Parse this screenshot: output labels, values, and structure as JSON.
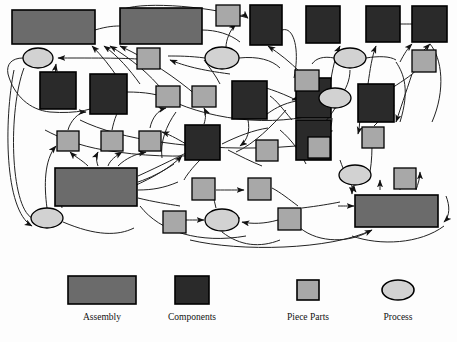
{
  "diagram": {
    "type": "network-relationship-diagram",
    "title_visible": false,
    "background": "#fdfdfd",
    "palette": {
      "assembly_fill": "#6b6b6b",
      "components_fill": "#2a2a2a",
      "piece_parts_fill": "#a8a8a8",
      "process_fill": "#d2d2d2",
      "stroke": "#000000",
      "edge_stroke": "#1a1a1a"
    },
    "node_counts": {
      "assembly": 4,
      "components": 11,
      "piece_parts": 16,
      "process": 6,
      "total": 37
    },
    "nodes": [
      {
        "id": "A1",
        "kind": "assembly",
        "x": 12,
        "y": 10,
        "w": 83,
        "h": 34
      },
      {
        "id": "A2",
        "kind": "assembly",
        "x": 120,
        "y": 8,
        "w": 82,
        "h": 36
      },
      {
        "id": "A3",
        "kind": "assembly",
        "x": 55,
        "y": 168,
        "w": 82,
        "h": 38
      },
      {
        "id": "A4",
        "kind": "assembly",
        "x": 355,
        "y": 195,
        "w": 83,
        "h": 32
      },
      {
        "id": "C1",
        "kind": "components",
        "x": 40,
        "y": 72,
        "w": 36,
        "h": 37
      },
      {
        "id": "C2",
        "kind": "components",
        "x": 90,
        "y": 74,
        "w": 37,
        "h": 40
      },
      {
        "id": "C3",
        "kind": "components",
        "x": 250,
        "y": 5,
        "w": 32,
        "h": 40
      },
      {
        "id": "C4",
        "kind": "components",
        "x": 306,
        "y": 6,
        "w": 34,
        "h": 37
      },
      {
        "id": "C5",
        "kind": "components",
        "x": 366,
        "y": 6,
        "w": 34,
        "h": 36
      },
      {
        "id": "C6",
        "kind": "components",
        "x": 412,
        "y": 6,
        "w": 35,
        "h": 36
      },
      {
        "id": "C7",
        "kind": "components",
        "x": 232,
        "y": 81,
        "w": 35,
        "h": 38
      },
      {
        "id": "C8",
        "kind": "components",
        "x": 296,
        "y": 78,
        "w": 35,
        "h": 40
      },
      {
        "id": "C9",
        "kind": "components",
        "x": 358,
        "y": 84,
        "w": 36,
        "h": 38
      },
      {
        "id": "C10",
        "kind": "components",
        "x": 185,
        "y": 125,
        "w": 35,
        "h": 35
      },
      {
        "id": "C11",
        "kind": "components",
        "x": 296,
        "y": 120,
        "w": 35,
        "h": 40
      },
      {
        "id": "P1",
        "kind": "piece_parts",
        "x": 137,
        "y": 48,
        "w": 23,
        "h": 21
      },
      {
        "id": "P2",
        "kind": "piece_parts",
        "x": 216,
        "y": 5,
        "w": 24,
        "h": 21
      },
      {
        "id": "P3",
        "kind": "piece_parts",
        "x": 412,
        "y": 50,
        "w": 24,
        "h": 22
      },
      {
        "id": "P4",
        "kind": "piece_parts",
        "x": 156,
        "y": 86,
        "w": 24,
        "h": 21
      },
      {
        "id": "P5",
        "kind": "piece_parts",
        "x": 192,
        "y": 86,
        "w": 24,
        "h": 21
      },
      {
        "id": "P6",
        "kind": "piece_parts",
        "x": 295,
        "y": 70,
        "w": 24,
        "h": 21
      },
      {
        "id": "P7",
        "kind": "piece_parts",
        "x": 57,
        "y": 131,
        "w": 22,
        "h": 20
      },
      {
        "id": "P8",
        "kind": "piece_parts",
        "x": 101,
        "y": 131,
        "w": 22,
        "h": 20
      },
      {
        "id": "P9",
        "kind": "piece_parts",
        "x": 139,
        "y": 131,
        "w": 22,
        "h": 20
      },
      {
        "id": "P10",
        "kind": "piece_parts",
        "x": 256,
        "y": 140,
        "w": 22,
        "h": 21
      },
      {
        "id": "P11",
        "kind": "piece_parts",
        "x": 308,
        "y": 137,
        "w": 22,
        "h": 21
      },
      {
        "id": "P12",
        "kind": "piece_parts",
        "x": 362,
        "y": 127,
        "w": 22,
        "h": 21
      },
      {
        "id": "P13",
        "kind": "piece_parts",
        "x": 394,
        "y": 168,
        "w": 22,
        "h": 21
      },
      {
        "id": "P14",
        "kind": "piece_parts",
        "x": 192,
        "y": 178,
        "w": 23,
        "h": 22
      },
      {
        "id": "P15",
        "kind": "piece_parts",
        "x": 248,
        "y": 178,
        "w": 23,
        "h": 22
      },
      {
        "id": "P16",
        "kind": "piece_parts",
        "x": 278,
        "y": 208,
        "w": 23,
        "h": 22
      },
      {
        "id": "P17",
        "kind": "piece_parts",
        "x": 163,
        "y": 211,
        "w": 23,
        "h": 22
      },
      {
        "id": "R1",
        "kind": "process",
        "cx": 38,
        "cy": 58,
        "rx": 15,
        "ry": 10
      },
      {
        "id": "R2",
        "kind": "process",
        "cx": 222,
        "cy": 58,
        "rx": 17,
        "ry": 11
      },
      {
        "id": "R3",
        "kind": "process",
        "cx": 350,
        "cy": 58,
        "rx": 16,
        "ry": 10
      },
      {
        "id": "R4",
        "kind": "process",
        "cx": 335,
        "cy": 98,
        "rx": 16,
        "ry": 10
      },
      {
        "id": "R5",
        "kind": "process",
        "cx": 355,
        "cy": 175,
        "rx": 16,
        "ry": 10
      },
      {
        "id": "R6",
        "kind": "process",
        "cx": 47,
        "cy": 218,
        "rx": 16,
        "ry": 10
      },
      {
        "id": "R7",
        "kind": "process",
        "cx": 222,
        "cy": 220,
        "rx": 17,
        "ry": 11
      }
    ]
  },
  "legend": {
    "items": [
      {
        "key": "assembly",
        "label": "Assembly",
        "swatch": "rect-wide",
        "fill": "#6b6b6b"
      },
      {
        "key": "components",
        "label": "Components",
        "swatch": "rect-square",
        "fill": "#2a2a2a"
      },
      {
        "key": "piece_parts",
        "label": "Piece Parts",
        "swatch": "rect-small",
        "fill": "#a8a8a8"
      },
      {
        "key": "process",
        "label": "Process",
        "swatch": "ellipse",
        "fill": "#d2d2d2"
      }
    ]
  }
}
